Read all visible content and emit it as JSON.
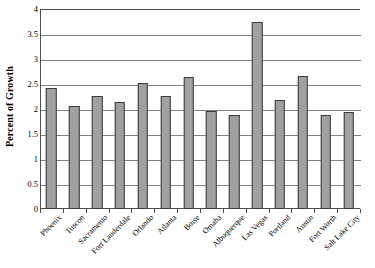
{
  "chart_data": {
    "type": "bar",
    "title": "",
    "xlabel": "",
    "ylabel": "Percent of Growth",
    "ylim": [
      0,
      4
    ],
    "ytick_labels": [
      "0",
      "0.5",
      "1",
      "1.5",
      "2",
      "2.5",
      "3",
      "3.5",
      "4"
    ],
    "ytick_values": [
      0,
      0.5,
      1,
      1.5,
      2,
      2.5,
      3,
      3.5,
      4
    ],
    "grid": true,
    "legend": false,
    "categories": [
      "Phoenix",
      "Tuscon",
      "Sacramento",
      "Fort Lauderdale",
      "Orlando",
      "Atlanta",
      "Boise",
      "Omaha",
      "Albuquerque",
      "Las Vegas",
      "Portland",
      "Austin",
      "Fort Worth",
      "Salt Lake City"
    ],
    "values": [
      2.43,
      2.07,
      2.26,
      2.14,
      2.52,
      2.26,
      2.64,
      1.96,
      1.89,
      3.75,
      2.18,
      2.66,
      1.88,
      1.94
    ],
    "bar_color": "#a0a0a0",
    "bar_edge_color": "#3b3b3b",
    "gridline_color": "#808080",
    "axis_color": "#4d4d4d"
  }
}
